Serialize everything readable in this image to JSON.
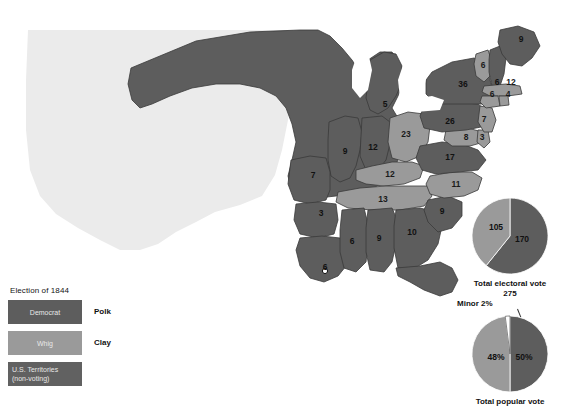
{
  "title": "Election of 1844",
  "colors": {
    "democrat": "#5d5d5d",
    "whig": "#9a9a9a",
    "territory": "#616161",
    "unorganized": "#ebebeb",
    "water": "#ffffff",
    "border": "#3a3a3a",
    "text": "#111111"
  },
  "legend": {
    "title": "Election of 1844",
    "items": [
      {
        "swatch_label": "Democrat",
        "candidate": "Polk",
        "color_key": "democrat"
      },
      {
        "swatch_label": "Whig",
        "candidate": "Clay",
        "color_key": "whig"
      },
      {
        "swatch_label": "U.S. Territories",
        "swatch_label_2": "(non-voting)",
        "candidate": "",
        "color_key": "territory"
      }
    ]
  },
  "states": [
    {
      "name": "Maine",
      "votes": "9",
      "party": "democrat",
      "x": 521,
      "y": 40
    },
    {
      "name": "Vermont",
      "votes": "6",
      "party": "whig",
      "x": 483,
      "y": 66
    },
    {
      "name": "New Hampshire",
      "votes": "6",
      "party": "democrat",
      "x": 497,
      "y": 83
    },
    {
      "name": "Massachusetts",
      "votes": "12",
      "party": "whig",
      "x": 511,
      "y": 83
    },
    {
      "name": "Rhode Island",
      "votes": "4",
      "party": "whig",
      "x": 508,
      "y": 95
    },
    {
      "name": "Connecticut",
      "votes": "6",
      "party": "whig",
      "x": 492,
      "y": 95
    },
    {
      "name": "New York",
      "votes": "36",
      "party": "democrat",
      "x": 463,
      "y": 85
    },
    {
      "name": "Pennsylvania",
      "votes": "26",
      "party": "democrat",
      "x": 450,
      "y": 122
    },
    {
      "name": "New Jersey",
      "votes": "7",
      "party": "whig",
      "x": 484,
      "y": 120
    },
    {
      "name": "Maryland",
      "votes": "8",
      "party": "whig",
      "x": 466,
      "y": 138
    },
    {
      "name": "Delaware",
      "votes": "3",
      "party": "whig",
      "x": 482,
      "y": 138
    },
    {
      "name": "Virginia",
      "votes": "17",
      "party": "democrat",
      "x": 450,
      "y": 158
    },
    {
      "name": "North Carolina",
      "votes": "11",
      "party": "whig",
      "x": 456,
      "y": 185
    },
    {
      "name": "South Carolina",
      "votes": "9",
      "party": "democrat",
      "x": 442,
      "y": 212
    },
    {
      "name": "Georgia",
      "votes": "10",
      "party": "democrat",
      "x": 412,
      "y": 233
    },
    {
      "name": "Alabama",
      "votes": "9",
      "party": "democrat",
      "x": 379,
      "y": 239
    },
    {
      "name": "Mississippi",
      "votes": "6",
      "party": "democrat",
      "x": 352,
      "y": 242
    },
    {
      "name": "Louisiana",
      "votes": "6",
      "party": "democrat",
      "x": 325,
      "y": 268
    },
    {
      "name": "Arkansas",
      "votes": "3",
      "party": "democrat",
      "x": 321,
      "y": 214
    },
    {
      "name": "Missouri",
      "votes": "7",
      "party": "democrat",
      "x": 313,
      "y": 176
    },
    {
      "name": "Tennessee",
      "votes": "13",
      "party": "whig",
      "x": 383,
      "y": 200
    },
    {
      "name": "Kentucky",
      "votes": "12",
      "party": "whig",
      "x": 390,
      "y": 175
    },
    {
      "name": "Illinois",
      "votes": "9",
      "party": "democrat",
      "x": 345,
      "y": 152
    },
    {
      "name": "Indiana",
      "votes": "12",
      "party": "democrat",
      "x": 373,
      "y": 148
    },
    {
      "name": "Ohio",
      "votes": "23",
      "party": "whig",
      "x": 406,
      "y": 135
    },
    {
      "name": "Michigan",
      "votes": "5",
      "party": "democrat",
      "x": 385,
      "y": 105
    }
  ],
  "chart_data": [
    {
      "type": "pie",
      "id": "electoral",
      "title": "Total electoral vote",
      "subtitle": "275",
      "categories": [
        "Democrat (Polk)",
        "Whig (Clay)"
      ],
      "values": [
        170,
        105
      ],
      "labels": [
        "170",
        "105"
      ],
      "colors": [
        "#5d5d5d",
        "#9a9a9a"
      ],
      "total": 275
    },
    {
      "type": "pie",
      "id": "popular",
      "title": "Total popular vote",
      "subtitle": "",
      "categories": [
        "Democrat (Polk)",
        "Whig (Clay)",
        "Minor"
      ],
      "values": [
        50,
        48,
        2
      ],
      "labels": [
        "50%",
        "48%",
        "Minor 2%"
      ],
      "colors": [
        "#5d5d5d",
        "#9a9a9a",
        "#ffffff"
      ],
      "annotation": "Minor 2%"
    }
  ]
}
